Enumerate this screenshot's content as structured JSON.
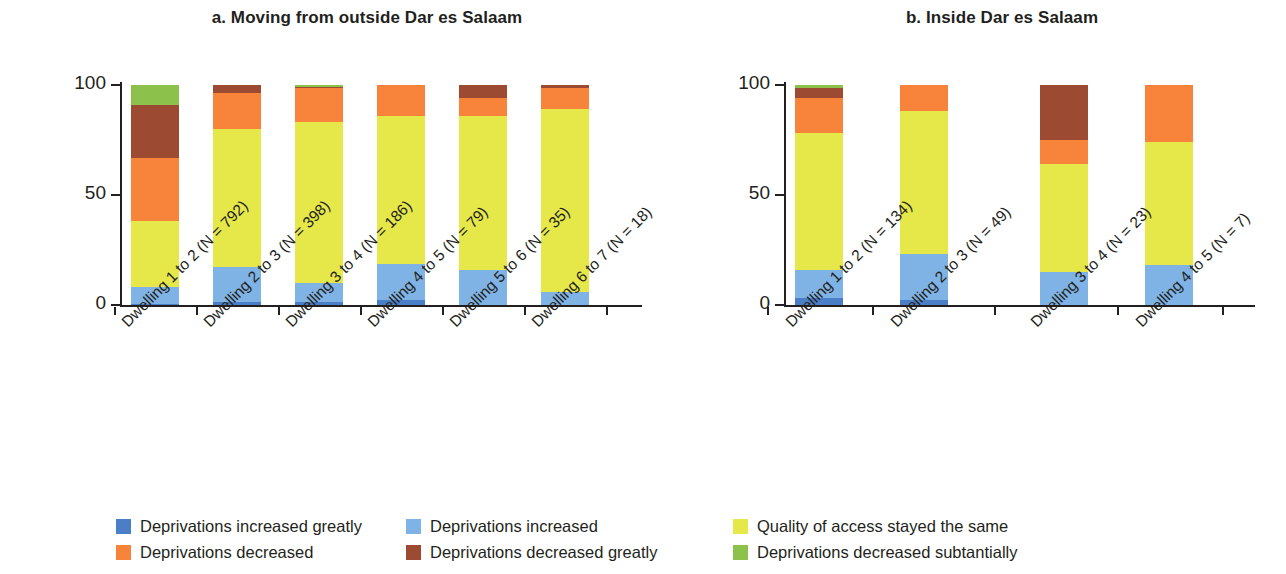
{
  "figure": {
    "ylabel": "Percentage of households",
    "yticks": [
      "0",
      "50",
      "100"
    ]
  },
  "panels": [
    {
      "id": "a",
      "title": "a. Moving from outside Dar es Salaam",
      "categories": [
        "Dwelling 1 to 2 (N = 792)",
        "Dwelling 2 to 3 (N = 398)",
        "Dwelling 3 to 4 (N = 186)",
        "Dwelling 4 to 5 (N = 79)",
        "Dwelling 5 to 6 (N = 35)",
        "Dwelling 6 to 7 (N = 18)"
      ]
    },
    {
      "id": "b",
      "title": "b. Inside Dar es Salaam",
      "categories": [
        "Dwelling 1 to 2 (N = 134)",
        "Dwelling 2 to 3 (N = 49)",
        "Dwelling 3 to 4 (N = 23)",
        "Dwelling 4 to 5 (N = 7)"
      ]
    }
  ],
  "legend": {
    "items": [
      {
        "label": "Deprivations increased greatly",
        "color": "#4a7fc8"
      },
      {
        "label": "Deprivations increased",
        "color": "#7fb3e5"
      },
      {
        "label": "Quality of access stayed the same",
        "color": "#e6e84a"
      },
      {
        "label": "Deprivations decreased",
        "color": "#f7843a"
      },
      {
        "label": "Deprivations decreased greatly",
        "color": "#9c4a32"
      },
      {
        "label": "Deprivations decreased subtantially",
        "color": "#8cc14c"
      }
    ]
  },
  "chart_data": {
    "type": "bar",
    "subtype": "stacked-100-percent",
    "xlabel": "",
    "ylabel": "Percentage of households",
    "ylim": [
      0,
      100
    ],
    "yticks": [
      0,
      50,
      100
    ],
    "grid": false,
    "legend_position": "bottom",
    "series_names": [
      "Deprivations increased greatly",
      "Deprivations increased",
      "Quality of access stayed the same",
      "Deprivations decreased",
      "Deprivations decreased greatly",
      "Deprivations decreased subtantially"
    ],
    "series_colors": [
      "#4a7fc8",
      "#7fb3e5",
      "#e6e84a",
      "#f7843a",
      "#9c4a32",
      "#8cc14c"
    ],
    "panels": [
      {
        "name": "a. Moving from outside Dar es Salaam",
        "categories": [
          "Dwelling 1 to 2 (N = 792)",
          "Dwelling 2 to 3 (N = 398)",
          "Dwelling 3 to 4 (N = 186)",
          "Dwelling 4 to 5 (N = 79)",
          "Dwelling 5 to 6 (N = 35)",
          "Dwelling 6 to 7 (N = 18)"
        ],
        "series": [
          {
            "name": "Deprivations increased greatly",
            "values": [
              0.5,
              1.5,
              1.5,
              2.5,
              0,
              0
            ]
          },
          {
            "name": "Deprivations increased",
            "values": [
              7.5,
              16,
              8.5,
              16,
              16,
              6
            ]
          },
          {
            "name": "Quality of access stayed the same",
            "values": [
              30,
              62.5,
              73,
              67.5,
              70,
              83
            ]
          },
          {
            "name": "Deprivations decreased",
            "values": [
              29,
              16.5,
              15.5,
              14,
              8,
              9.5
            ]
          },
          {
            "name": "Deprivations decreased greatly",
            "values": [
              24,
              3.5,
              0.5,
              0,
              6,
              1.5
            ]
          },
          {
            "name": "Deprivations decreased subtantially",
            "values": [
              9,
              0,
              1,
              0,
              0,
              0
            ]
          }
        ]
      },
      {
        "name": "b. Inside Dar es Salaam",
        "categories": [
          "Dwelling 1 to 2 (N = 134)",
          "Dwelling 2 to 3 (N = 49)",
          "Dwelling 3 to 4 (N = 23)",
          "Dwelling 4 to 5 (N = 7)"
        ],
        "series": [
          {
            "name": "Deprivations increased greatly",
            "values": [
              3,
              2.5,
              0,
              0
            ]
          },
          {
            "name": "Deprivations increased",
            "values": [
              13,
              20.5,
              15,
              18
            ]
          },
          {
            "name": "Quality of access stayed the same",
            "values": [
              62,
              65,
              49,
              56
            ]
          },
          {
            "name": "Deprivations decreased",
            "values": [
              16,
              12,
              11,
              26
            ]
          },
          {
            "name": "Deprivations decreased greatly",
            "values": [
              4.5,
              0,
              25,
              0
            ]
          },
          {
            "name": "Deprivations decreased subtantially",
            "values": [
              1.5,
              0,
              0,
              0
            ]
          }
        ]
      }
    ]
  },
  "geometry": {
    "plot_top": 85,
    "plot_bottom": 305,
    "bar_width": 48,
    "panel_a_bar_x": [
      131,
      213,
      295,
      377,
      459,
      541
    ],
    "panel_a_axis_x": 120,
    "panel_a_axis_right": 642,
    "panel_b_bar_x": [
      795,
      900,
      1040,
      1145
    ],
    "panel_b_axis_x": 784,
    "panel_b_axis_right": 1255,
    "xlabel_a_x": [
      118,
      200,
      282,
      364,
      446,
      528
    ],
    "xlabel_b_x": [
      782,
      887,
      1027,
      1132
    ],
    "xlabel_y": 318,
    "legend_row1_y": 0,
    "legend_row2_y": 26,
    "legend_col_x": [
      0,
      290,
      617
    ]
  }
}
